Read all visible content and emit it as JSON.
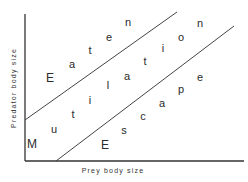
{
  "diagram": {
    "x_axis_label": "Prey body size",
    "y_axis_label": "Predator body size",
    "zones": [
      {
        "name": "Eaten",
        "letters": [
          {
            "ch": "E",
            "x": 50,
            "y": 82,
            "size": 12
          },
          {
            "ch": "a",
            "x": 72,
            "y": 68
          },
          {
            "ch": "t",
            "x": 90,
            "y": 54
          },
          {
            "ch": "e",
            "x": 109,
            "y": 41
          },
          {
            "ch": "n",
            "x": 128,
            "y": 26
          }
        ]
      },
      {
        "name": "Mutilation",
        "letters": [
          {
            "ch": "M",
            "x": 32,
            "y": 148,
            "size": 12
          },
          {
            "ch": "u",
            "x": 54,
            "y": 133
          },
          {
            "ch": "t",
            "x": 73,
            "y": 118
          },
          {
            "ch": "i",
            "x": 90,
            "y": 104
          },
          {
            "ch": "l",
            "x": 108,
            "y": 89
          },
          {
            "ch": "a",
            "x": 127,
            "y": 80
          },
          {
            "ch": "t",
            "x": 145,
            "y": 65
          },
          {
            "ch": "i",
            "x": 163,
            "y": 52
          },
          {
            "ch": "o",
            "x": 181,
            "y": 41
          },
          {
            "ch": "n",
            "x": 200,
            "y": 27
          }
        ]
      },
      {
        "name": "Escape",
        "letters": [
          {
            "ch": "E",
            "x": 105,
            "y": 149,
            "size": 12
          },
          {
            "ch": "s",
            "x": 124,
            "y": 134
          },
          {
            "ch": "c",
            "x": 143,
            "y": 120
          },
          {
            "ch": "a",
            "x": 162,
            "y": 107
          },
          {
            "ch": "p",
            "x": 181,
            "y": 93
          },
          {
            "ch": "e",
            "x": 200,
            "y": 81
          }
        ]
      }
    ],
    "lines": [
      {
        "name": "upper-boundary",
        "x1": 25,
        "y1": 120,
        "x2": 177,
        "y2": 12
      },
      {
        "name": "lower-boundary",
        "x1": 56,
        "y1": 161,
        "x2": 234,
        "y2": 26
      }
    ],
    "axes": {
      "origin_x": 25,
      "origin_y": 161,
      "x_end": 244,
      "y_top": 14
    }
  }
}
